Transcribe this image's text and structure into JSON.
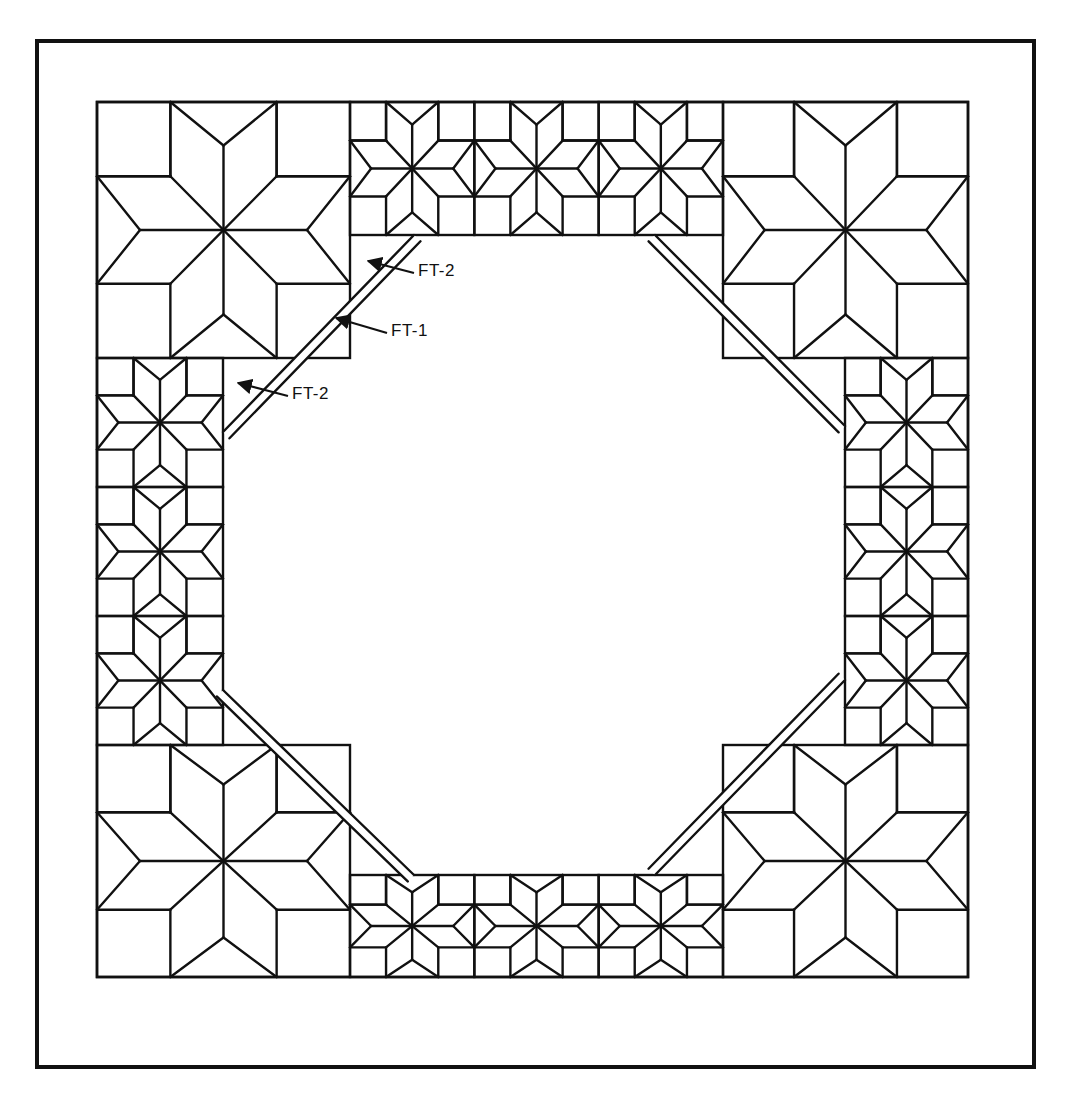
{
  "figure": {
    "type": "quilt-pattern-diagram",
    "stroke_color": "#111111",
    "background": "#ffffff"
  },
  "frame": {
    "x": 37,
    "y": 41,
    "w": 997,
    "h": 1026,
    "stroke_width": 4
  },
  "quilt": {
    "x": 97,
    "y": 102,
    "w": 871,
    "h": 875
  },
  "corner_blocks": [
    {
      "id": "top-left",
      "x": 97,
      "y": 102,
      "w": 253,
      "h": 256
    },
    {
      "id": "top-right",
      "x": 723,
      "y": 102,
      "w": 245,
      "h": 256
    },
    {
      "id": "bottom-left",
      "x": 97,
      "y": 745,
      "w": 253,
      "h": 232
    },
    {
      "id": "bottom-right",
      "x": 723,
      "y": 745,
      "w": 245,
      "h": 232
    }
  ],
  "strips": [
    {
      "id": "top",
      "orientation": "horizontal",
      "x": 350,
      "y": 102,
      "w": 373,
      "h": 133,
      "blocks": 3
    },
    {
      "id": "bottom",
      "orientation": "horizontal",
      "x": 350,
      "y": 875,
      "w": 373,
      "h": 102,
      "blocks": 3
    },
    {
      "id": "left",
      "orientation": "vertical",
      "x": 97,
      "y": 358,
      "w": 126,
      "h": 387,
      "blocks": 3
    },
    {
      "id": "right",
      "orientation": "vertical",
      "x": 845,
      "y": 358,
      "w": 123,
      "h": 387,
      "blocks": 3
    }
  ],
  "diagonals": [
    {
      "id": "nw",
      "x1": 223,
      "y1": 432,
      "x2": 414,
      "y2": 235
    },
    {
      "id": "ne",
      "x1": 655,
      "y1": 235,
      "x2": 845,
      "y2": 426
    },
    {
      "id": "sw",
      "x1": 223,
      "y1": 690,
      "x2": 414,
      "y2": 875
    },
    {
      "id": "se",
      "x1": 845,
      "y1": 680,
      "x2": 655,
      "y2": 875
    }
  ],
  "diagonal_band_offset": 9,
  "labels": [
    {
      "text": "FT-2",
      "x": 418,
      "y": 271,
      "arrow_to": [
        368,
        261
      ]
    },
    {
      "text": "FT-1",
      "x": 391,
      "y": 331,
      "arrow_to": [
        336,
        318
      ]
    },
    {
      "text": "FT-2",
      "x": 292,
      "y": 394,
      "arrow_to": [
        238,
        383
      ]
    }
  ]
}
